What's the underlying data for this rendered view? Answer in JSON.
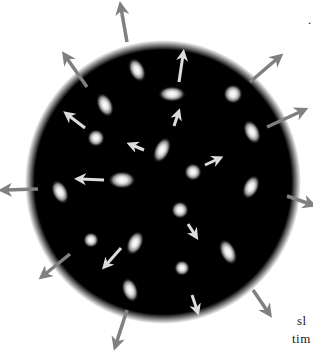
{
  "illustration": {
    "subject": "expanding universe",
    "background_color": "#ffffff",
    "sphere_color": "#000000",
    "arrow_color_outer": "#808080",
    "arrow_color_inner": "#d8d8d8",
    "galaxy_color": "#f0f0f0"
  },
  "text_fragments": {
    "line1": "sl",
    "line2": "tim",
    "mark": "."
  }
}
